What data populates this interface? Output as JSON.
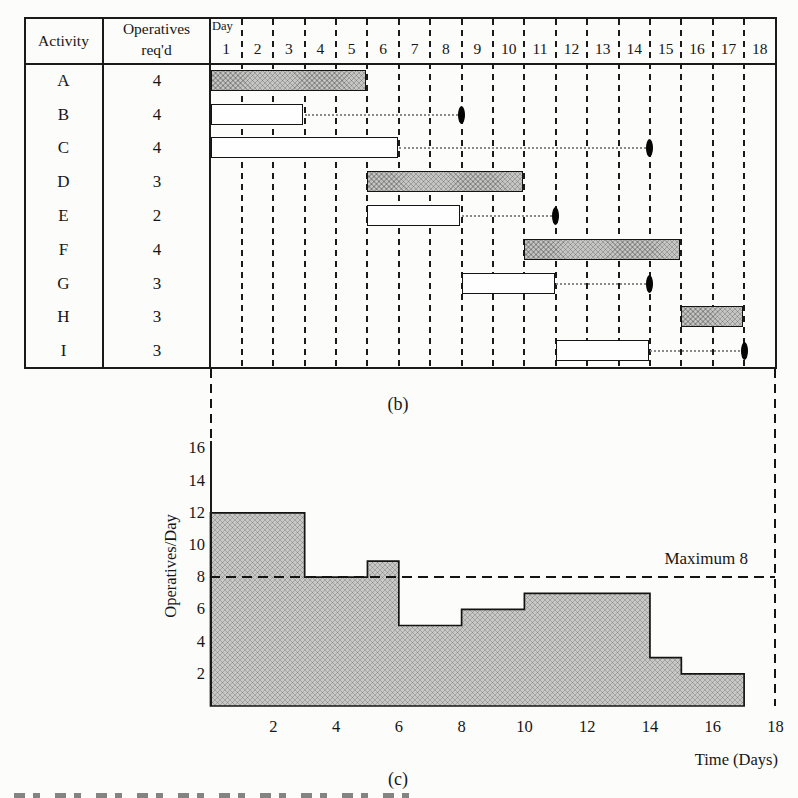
{
  "table": {
    "col1_header": "Activity",
    "col2_header_line1": "Operatives",
    "col2_header_line2": "req'd",
    "day_header": "Day",
    "days": [
      "1",
      "2",
      "3",
      "4",
      "5",
      "6",
      "7",
      "8",
      "9",
      "10",
      "11",
      "12",
      "13",
      "14",
      "15",
      "16",
      "17",
      "18"
    ],
    "rows": [
      {
        "activity": "A",
        "operatives": "4",
        "bar_start": 1,
        "bar_end": 5,
        "shaded": true,
        "float_to_day": null
      },
      {
        "activity": "B",
        "operatives": "4",
        "bar_start": 1,
        "bar_end": 3,
        "shaded": false,
        "float_to_day": 8
      },
      {
        "activity": "C",
        "operatives": "4",
        "bar_start": 1,
        "bar_end": 6,
        "shaded": false,
        "float_to_day": 14
      },
      {
        "activity": "D",
        "operatives": "3",
        "bar_start": 6,
        "bar_end": 10,
        "shaded": true,
        "float_to_day": null
      },
      {
        "activity": "E",
        "operatives": "2",
        "bar_start": 6,
        "bar_end": 8,
        "shaded": false,
        "float_to_day": 11
      },
      {
        "activity": "F",
        "operatives": "4",
        "bar_start": 11,
        "bar_end": 15,
        "shaded": true,
        "float_to_day": null
      },
      {
        "activity": "G",
        "operatives": "3",
        "bar_start": 9,
        "bar_end": 11,
        "shaded": false,
        "float_to_day": 14
      },
      {
        "activity": "H",
        "operatives": "3",
        "bar_start": 16,
        "bar_end": 17,
        "shaded": true,
        "float_to_day": null
      },
      {
        "activity": "I",
        "operatives": "3",
        "bar_start": 12,
        "bar_end": 14,
        "shaded": false,
        "float_to_day": 17
      }
    ]
  },
  "captions": {
    "b": "(b)",
    "c": "(c)"
  },
  "chart_data": [
    {
      "type": "gantt",
      "title": "",
      "time_axis": {
        "label": "Day",
        "range": [
          1,
          18
        ]
      },
      "bars": [
        {
          "activity": "A",
          "operatives": 4,
          "start_day": 1,
          "end_day": 5,
          "critical_shaded": true
        },
        {
          "activity": "B",
          "operatives": 4,
          "start_day": 1,
          "end_day": 3,
          "critical_shaded": false,
          "float_to_day": 8
        },
        {
          "activity": "C",
          "operatives": 4,
          "start_day": 1,
          "end_day": 6,
          "critical_shaded": false,
          "float_to_day": 14
        },
        {
          "activity": "D",
          "operatives": 3,
          "start_day": 6,
          "end_day": 10,
          "critical_shaded": true
        },
        {
          "activity": "E",
          "operatives": 2,
          "start_day": 6,
          "end_day": 8,
          "critical_shaded": false,
          "float_to_day": 11
        },
        {
          "activity": "F",
          "operatives": 4,
          "start_day": 11,
          "end_day": 15,
          "critical_shaded": true
        },
        {
          "activity": "G",
          "operatives": 3,
          "start_day": 9,
          "end_day": 11,
          "critical_shaded": false,
          "float_to_day": 14
        },
        {
          "activity": "H",
          "operatives": 3,
          "start_day": 16,
          "end_day": 17,
          "critical_shaded": true
        },
        {
          "activity": "I",
          "operatives": 3,
          "start_day": 12,
          "end_day": 14,
          "critical_shaded": false,
          "float_to_day": 17
        }
      ]
    },
    {
      "type": "area",
      "subtype": "step-histogram",
      "title": "",
      "xlabel": "Time (Days)",
      "ylabel": "Operatives/Day",
      "xlim": [
        0,
        18
      ],
      "ylim": [
        0,
        17
      ],
      "x_ticks": [
        2,
        4,
        6,
        8,
        10,
        12,
        14,
        16,
        18
      ],
      "y_ticks": [
        16,
        14,
        12,
        10,
        8,
        6,
        4,
        2
      ],
      "steps": [
        {
          "from": 0,
          "to": 3,
          "value": 12
        },
        {
          "from": 3,
          "to": 5,
          "value": 8
        },
        {
          "from": 5,
          "to": 6,
          "value": 9
        },
        {
          "from": 6,
          "to": 8,
          "value": 5
        },
        {
          "from": 8,
          "to": 10,
          "value": 6
        },
        {
          "from": 10,
          "to": 14,
          "value": 7
        },
        {
          "from": 14,
          "to": 15,
          "value": 3
        },
        {
          "from": 15,
          "to": 17,
          "value": 2
        }
      ],
      "max_line": {
        "value": 8,
        "label": "Maximum 8"
      },
      "grid": false,
      "legend": null
    }
  ],
  "colors": {
    "ink": "#1a1a1a",
    "shaded_fill": "#c5c5c3",
    "paper": "#fcfcfa"
  }
}
